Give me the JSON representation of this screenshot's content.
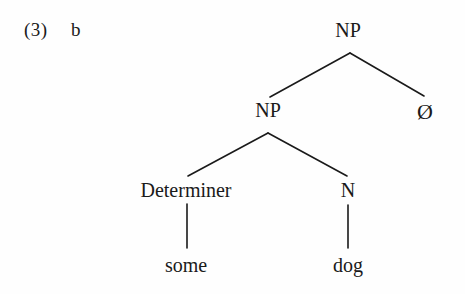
{
  "example": {
    "number": "(3)",
    "letter": "b"
  },
  "tree": {
    "nodes": [
      {
        "id": "root-np",
        "label": "NP",
        "x": 348,
        "y": 30
      },
      {
        "id": "inner-np",
        "label": "NP",
        "x": 268,
        "y": 110
      },
      {
        "id": "null-node",
        "label": "Ø",
        "x": 425,
        "y": 112
      },
      {
        "id": "determiner",
        "label": "Determiner",
        "x": 186,
        "y": 190
      },
      {
        "id": "noun",
        "label": "N",
        "x": 348,
        "y": 190
      }
    ],
    "leaves": [
      {
        "id": "leaf-some",
        "label": "some",
        "x": 186,
        "y": 265
      },
      {
        "id": "leaf-dog",
        "label": "dog",
        "x": 348,
        "y": 265
      }
    ],
    "edges": [
      {
        "id": "root-to-inner-np",
        "x1": 350,
        "y1": 53,
        "x2": 270,
        "y2": 97
      },
      {
        "id": "root-to-null",
        "x1": 350,
        "y1": 53,
        "x2": 424,
        "y2": 96
      },
      {
        "id": "np-to-determiner",
        "x1": 268,
        "y1": 133,
        "x2": 188,
        "y2": 176
      },
      {
        "id": "np-to-noun",
        "x1": 268,
        "y1": 133,
        "x2": 347,
        "y2": 176
      },
      {
        "id": "determiner-to-some",
        "x1": 187,
        "y1": 204,
        "x2": 187,
        "y2": 248
      },
      {
        "id": "noun-to-dog",
        "x1": 348,
        "y1": 205,
        "x2": 348,
        "y2": 248
      }
    ],
    "line_color": "#1a1a1a",
    "text_color": "#1a1a1a",
    "background_color": "#fefefe"
  }
}
